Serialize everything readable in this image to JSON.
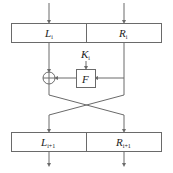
{
  "diagram": {
    "top_block": {
      "left": {
        "main": "L",
        "sub": "i"
      },
      "right": {
        "main": "R",
        "sub": "i"
      }
    },
    "key": {
      "main": "K",
      "sub": "i"
    },
    "function": {
      "label": "F"
    },
    "xor": {
      "symbol": "xor-operator"
    },
    "bottom_block": {
      "left": {
        "main": "L",
        "sub": "i+1"
      },
      "right": {
        "main": "R",
        "sub": "i+1"
      }
    },
    "colors": {
      "stroke": "#6a6a6a",
      "text": "#222222",
      "background": "#ffffff"
    }
  }
}
